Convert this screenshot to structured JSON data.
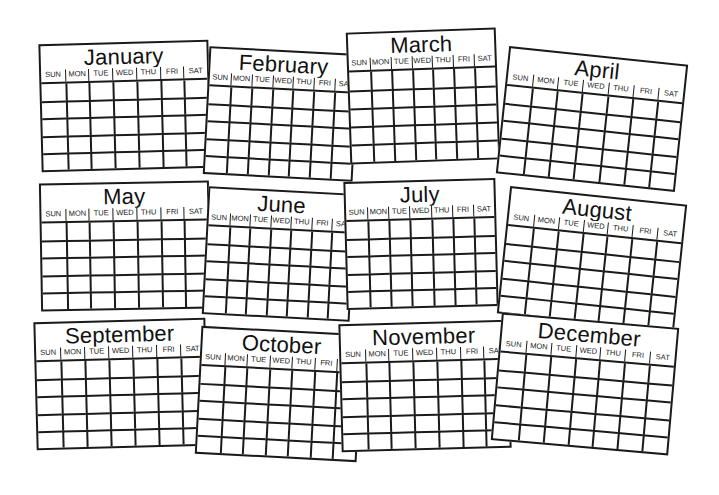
{
  "weekdays": [
    "SUN",
    "MON",
    "TUE",
    "WED",
    "THU",
    "FRI",
    "SAT"
  ],
  "rows_per_month": 5,
  "line_color": "#1a1a1a",
  "months": [
    {
      "name": "January",
      "left": 40,
      "top": 42,
      "width": 170,
      "height": 128,
      "rotate": -1.5,
      "z": 2
    },
    {
      "name": "February",
      "left": 206,
      "top": 50,
      "width": 150,
      "height": 128,
      "rotate": 3,
      "z": 3
    },
    {
      "name": "March",
      "left": 348,
      "top": 30,
      "width": 150,
      "height": 132,
      "rotate": -2,
      "z": 4
    },
    {
      "name": "April",
      "left": 502,
      "top": 55,
      "width": 180,
      "height": 128,
      "rotate": 6,
      "z": 5
    },
    {
      "name": "May",
      "left": 40,
      "top": 182,
      "width": 170,
      "height": 128,
      "rotate": -1,
      "z": 6
    },
    {
      "name": "June",
      "left": 205,
      "top": 190,
      "width": 148,
      "height": 128,
      "rotate": 3,
      "z": 7
    },
    {
      "name": "July",
      "left": 345,
      "top": 180,
      "width": 152,
      "height": 128,
      "rotate": -1.5,
      "z": 8
    },
    {
      "name": "August",
      "left": 503,
      "top": 195,
      "width": 178,
      "height": 128,
      "rotate": 6,
      "z": 9
    },
    {
      "name": "September",
      "left": 35,
      "top": 320,
      "width": 172,
      "height": 128,
      "rotate": -1.5,
      "z": 10
    },
    {
      "name": "October",
      "left": 198,
      "top": 330,
      "width": 162,
      "height": 128,
      "rotate": 3,
      "z": 11
    },
    {
      "name": "November",
      "left": 340,
      "top": 322,
      "width": 170,
      "height": 128,
      "rotate": -1.5,
      "z": 12
    },
    {
      "name": "December",
      "left": 496,
      "top": 320,
      "width": 178,
      "height": 128,
      "rotate": 5,
      "z": 13
    }
  ]
}
